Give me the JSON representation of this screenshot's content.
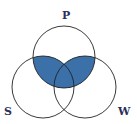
{
  "diagram": {
    "type": "venn",
    "sets": [
      {
        "label": "P",
        "cx": 64,
        "cy": 57,
        "r": 31
      },
      {
        "label": "S",
        "cx": 43,
        "cy": 87,
        "r": 31
      },
      {
        "label": "W",
        "cx": 85,
        "cy": 87,
        "r": 31
      }
    ],
    "shaded_region": "P ∩ (S ∪ W)",
    "fill_color": "#3b70a8",
    "stroke_color": "#222222"
  },
  "labels": {
    "p": "P",
    "s": "S",
    "w": "W"
  }
}
